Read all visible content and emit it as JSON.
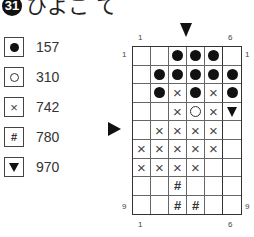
{
  "title": {
    "number": "31",
    "text": "ひよこ て"
  },
  "legend": [
    {
      "symbol": "filled-circle",
      "code": "157"
    },
    {
      "symbol": "open-circle",
      "code": "310"
    },
    {
      "symbol": "cross",
      "code": "742"
    },
    {
      "symbol": "hash",
      "code": "780"
    },
    {
      "symbol": "triangle-down",
      "code": "970"
    }
  ],
  "chart": {
    "columns": 6,
    "rows": 9,
    "top_labels": {
      "left": "1",
      "right": "6"
    },
    "bottom_labels": {
      "left": "1",
      "right": "6"
    },
    "left_labels": {
      "top": "1",
      "bottom": "9"
    },
    "right_labels": {
      "top": "1",
      "bottom": "9"
    },
    "center_markers": {
      "top_column_boundary": "3-4",
      "left_row": 5
    },
    "cells": [
      [
        "",
        "",
        "filled-circle",
        "filled-circle",
        "filled-circle",
        ""
      ],
      [
        "",
        "filled-circle",
        "filled-circle",
        "filled-circle",
        "filled-circle",
        "filled-circle"
      ],
      [
        "",
        "filled-circle",
        "cross",
        "filled-circle",
        "cross",
        "filled-circle"
      ],
      [
        "",
        "",
        "cross",
        "open-circle",
        "cross",
        "triangle-down"
      ],
      [
        "",
        "cross",
        "cross",
        "cross",
        "cross",
        ""
      ],
      [
        "cross",
        "cross",
        "cross",
        "cross",
        "cross",
        ""
      ],
      [
        "cross",
        "cross",
        "cross",
        "cross",
        "",
        ""
      ],
      [
        "",
        "",
        "hash",
        "",
        "",
        ""
      ],
      [
        "",
        "",
        "hash",
        "hash",
        "",
        ""
      ]
    ]
  }
}
